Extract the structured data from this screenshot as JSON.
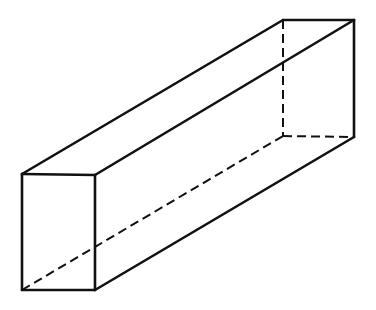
{
  "diagram": {
    "type": "rectangular-prism-wireframe",
    "colors": {
      "background": "#ffffff",
      "line": "#111111"
    },
    "vertices": {
      "front_top_left": [
        22,
        174
      ],
      "front_top_right": [
        95,
        175
      ],
      "front_bottom_left": [
        22,
        290
      ],
      "front_bottom_right": [
        95,
        290
      ],
      "back_top_left": [
        283,
        20
      ],
      "back_top_right": [
        354,
        20
      ],
      "back_bottom_left": [
        283,
        136
      ],
      "back_bottom_right": [
        354,
        137
      ]
    },
    "visible_edges": [
      [
        "front_top_left",
        "front_top_right"
      ],
      [
        "front_top_right",
        "front_bottom_right"
      ],
      [
        "front_bottom_right",
        "front_bottom_left"
      ],
      [
        "front_bottom_left",
        "front_top_left"
      ],
      [
        "front_top_left",
        "back_top_left"
      ],
      [
        "back_top_left",
        "back_top_right"
      ],
      [
        "front_top_right",
        "back_top_right"
      ],
      [
        "back_top_right",
        "back_bottom_right"
      ],
      [
        "front_bottom_right",
        "back_bottom_right"
      ]
    ],
    "hidden_edges": [
      [
        "back_top_left",
        "back_bottom_left"
      ],
      [
        "back_bottom_left",
        "back_bottom_right"
      ],
      [
        "front_bottom_left",
        "back_bottom_left"
      ]
    ]
  }
}
